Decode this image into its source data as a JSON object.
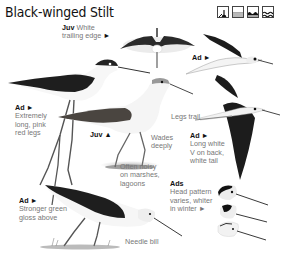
{
  "header": {
    "title": "Black-winged Stilt",
    "habitat_icons": [
      {
        "name": "reedbed-icon"
      },
      {
        "name": "marsh-icon"
      },
      {
        "name": "shoreline-icon"
      },
      {
        "name": "water-icon"
      }
    ]
  },
  "labels": {
    "juv_flight": {
      "head": "Juv",
      "text": "White",
      "text2": "trailing edge",
      "arrow": "►"
    },
    "ad_flight_top": {
      "head": "Ad",
      "arrow": "►"
    },
    "ad_left": {
      "head": "Ad",
      "arrow": "►",
      "lines": [
        "Extremely",
        "long, pink",
        "red legs"
      ]
    },
    "juv_standing": {
      "head": "Juv",
      "arrow": "▲"
    },
    "wades": {
      "lines": [
        "Wades",
        "deeply"
      ]
    },
    "legs_trail": {
      "text": "Legs trail"
    },
    "ad_flight_right": {
      "head": "Ad",
      "arrow": "►",
      "lines": [
        "Long white",
        "V on back,",
        "white tail"
      ]
    },
    "noisy": {
      "lines": [
        "Often noisy",
        "on marshes,",
        "lagoons"
      ]
    },
    "ads_heads": {
      "head": "Ads",
      "lines": [
        "Head pattern",
        "varies, whiter",
        "in winter ►"
      ]
    },
    "ad_bottom": {
      "head": "Ad",
      "arrow": "►",
      "lines": [
        "Stronger green",
        "gloss above"
      ]
    },
    "needle_bill": {
      "text": "Needle bill"
    }
  },
  "colors": {
    "ink": "#111111",
    "caption": "#777777",
    "wing_black": "#1c1c1c",
    "leg_pink": "#6b5a58",
    "juv_brown": "#4a4540"
  }
}
